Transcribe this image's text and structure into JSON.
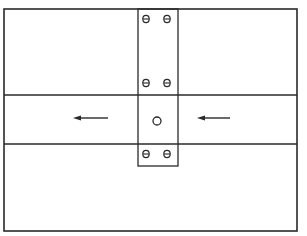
{
  "diagram": {
    "colors": {
      "line": "#2a2a2a",
      "background": "#ffffff"
    },
    "outer_box": {
      "x": 4,
      "y": 9,
      "w": 293,
      "h": 222
    },
    "band": {
      "y_top": 95,
      "y_bottom": 144
    },
    "strip": {
      "x": 138,
      "y": 9,
      "w": 40,
      "h": 157
    },
    "screws": [
      {
        "cx": 146,
        "cy": 19
      },
      {
        "cx": 167,
        "cy": 19
      },
      {
        "cx": 146,
        "cy": 83
      },
      {
        "cx": 167,
        "cy": 83
      },
      {
        "cx": 146,
        "cy": 154
      },
      {
        "cx": 167,
        "cy": 154
      }
    ],
    "center_hole": {
      "cx": 157,
      "cy": 121,
      "r": 4
    },
    "arrows": [
      {
        "name": "left-arrow",
        "x1": 108,
        "x2": 73,
        "y": 118,
        "direction": "left"
      },
      {
        "name": "right-arrow",
        "x1": 230,
        "x2": 197,
        "y": 118,
        "direction": "left"
      }
    ]
  }
}
